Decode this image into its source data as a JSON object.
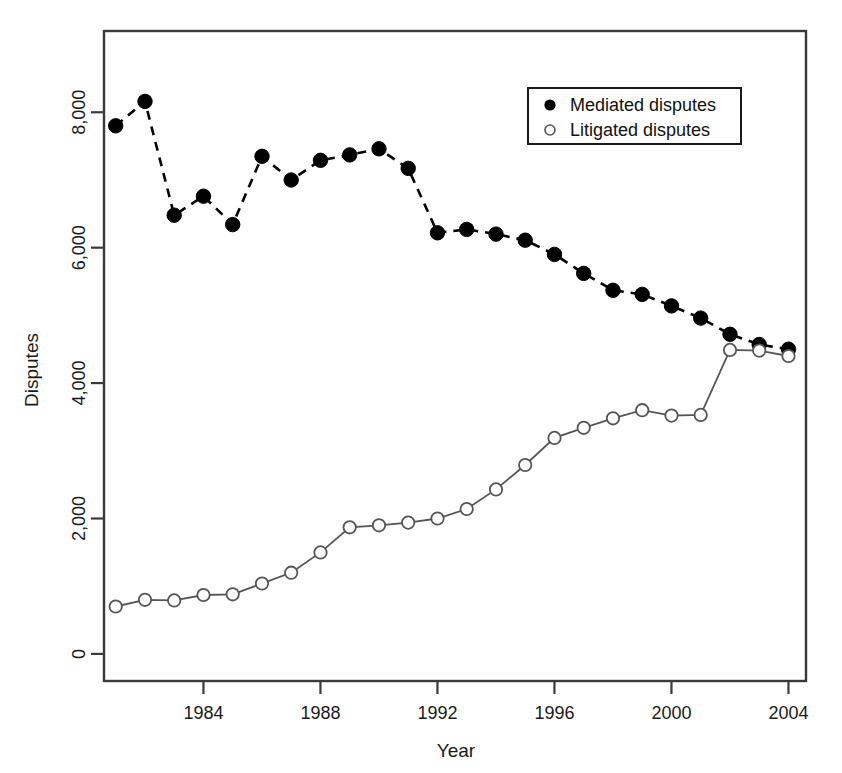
{
  "chart_data": {
    "type": "line",
    "title": "",
    "xlabel": "Year",
    "ylabel": "Disputes",
    "xlim": [
      1980.6,
      2004.6
    ],
    "ylim": [
      -400,
      9200
    ],
    "xticks": [
      1984,
      1988,
      1992,
      1996,
      2000,
      2004
    ],
    "xtick_labels": [
      "1984",
      "1988",
      "1992",
      "1996",
      "2000",
      "2004"
    ],
    "yticks": [
      0,
      2000,
      4000,
      6000,
      8000
    ],
    "ytick_labels": [
      "0",
      "2,000",
      "4,000",
      "6,000",
      "8,000"
    ],
    "grid": false,
    "legend_position": "top-right",
    "x": [
      1981,
      1982,
      1983,
      1984,
      1985,
      1986,
      1987,
      1988,
      1989,
      1990,
      1991,
      1992,
      1993,
      1994,
      1995,
      1996,
      1997,
      1998,
      1999,
      2000,
      2001,
      2002,
      2003,
      2004
    ],
    "series": [
      {
        "name": "Mediated disputes",
        "marker": "filled-circle",
        "line_style": "dashed",
        "color": "#000000",
        "values": [
          7800,
          8160,
          6480,
          6760,
          6340,
          7350,
          7000,
          7290,
          7370,
          7460,
          7170,
          6220,
          6270,
          6200,
          6110,
          5900,
          5620,
          5370,
          5310,
          5140,
          4960,
          4720,
          4570,
          4500
        ]
      },
      {
        "name": "Litigated disputes",
        "marker": "open-circle",
        "line_style": "solid",
        "color": "#555555",
        "values": [
          700,
          800,
          790,
          870,
          880,
          1040,
          1200,
          1500,
          1870,
          1900,
          1940,
          2000,
          2140,
          2430,
          2790,
          3190,
          3340,
          3480,
          3600,
          3520,
          3530,
          4490,
          4480,
          4400
        ]
      }
    ]
  },
  "legend": {
    "entries": [
      {
        "label": "Mediated disputes",
        "marker": "filled-circle"
      },
      {
        "label": "Litigated disputes",
        "marker": "open-circle"
      }
    ]
  },
  "axes": {
    "x_title": "Year",
    "y_title": "Disputes"
  }
}
